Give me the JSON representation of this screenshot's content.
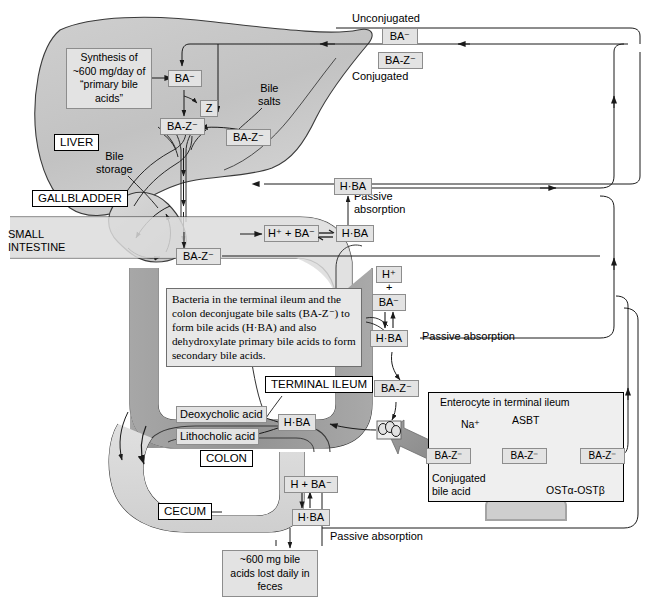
{
  "diagram": {
    "colors": {
      "liver_fill": "#c7c7c7",
      "intestine_fill": "#d8d8d8",
      "ileum_fill": "#9a9a9a",
      "label_fill": "#e3e3e3",
      "line": "#1a1a1a"
    }
  },
  "top": {
    "unconjugated_label": "Unconjugated",
    "unconjugated_species": "BA⁻",
    "conjugated_species": "BA-Z⁻",
    "conjugated_label": "Conjugated"
  },
  "liver": {
    "organ_label": "LIVER",
    "synthesis_note": "Synthesis of\n~600 mg/day\nof “primary\nbile acids”",
    "ba": "BA⁻",
    "z": "Z",
    "baz_liver": "BA-Z⁻",
    "baz_incoming": "BA-Z⁻",
    "bile_salts": "Bile\nsalts"
  },
  "gallbladder": {
    "organ_label": "GALLBLADDER",
    "bile_storage": "Bile\nstorage"
  },
  "small_intestine": {
    "organ_label": "SMALL\nINTESTINE",
    "baz_duct": "BA-Z⁻",
    "dissociation": "H⁺ + BA⁻",
    "hba": "H·BA",
    "hba_absorbed": "H·BA",
    "passive_absorption": "Passive\nabsorption"
  },
  "ileum": {
    "organ_label": "TERMINAL\nILEUM",
    "h_plus": "H⁺",
    "plus": "+",
    "ba": "BA⁻",
    "hba": "H·BA",
    "baz": "BA-Z⁻",
    "hba_lower": "H·BA",
    "passive_absorption": "Passive absorption",
    "bacteria_note": "Bacteria in the terminal ileum and the colon deconjugate bile salts (BA-Z⁻) to form bile acids (H·BA) and also dehydroxylate primary bile acids to form secondary bile acids."
  },
  "secondary_acids": {
    "deoxycholic": "Deoxycholic acid",
    "lithocholic": "Lithocholic acid"
  },
  "colon": {
    "organ_label": "COLON",
    "cecum_label": "CECUM",
    "h_ba": "H + BA⁻",
    "hba": "H·BA",
    "passive_absorption": "Passive absorption",
    "loss_note": "~600 mg bile\nacids lost\ndaily in feces"
  },
  "enterocyte": {
    "title": "Enterocyte in terminal ileum",
    "sodium": "Na⁺",
    "asbt": "ASBT",
    "baz_lumen": "BA-Z⁻",
    "baz_cytosol": "BA-Z⁻",
    "baz_basolateral": "BA-Z⁻",
    "conjugated_bile_acid": "Conjugated\nbile acid",
    "ost": "OSTα-OSTβ"
  }
}
